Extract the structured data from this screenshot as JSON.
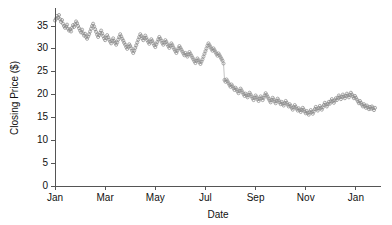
{
  "chart_data": {
    "type": "scatter",
    "title": "",
    "xlabel": "Date",
    "ylabel": "Closing Price ($)",
    "xlim": [
      0,
      13
    ],
    "ylim": [
      0,
      38.5
    ],
    "grid": false,
    "legend": null,
    "marker": "open-circle",
    "marker_color": "#8c8c8c",
    "line_color": "#9a9a9a",
    "y_ticks": [
      0,
      5,
      10,
      15,
      20,
      25,
      30,
      35
    ],
    "y_tick_labels": [
      "0",
      "5",
      "10",
      "15",
      "20",
      "25",
      "30",
      "35"
    ],
    "x_ticks": [
      0,
      2,
      4,
      6,
      8,
      10,
      12
    ],
    "x_tick_labels": [
      "Jan",
      "Mar",
      "May",
      "Jul",
      "Sep",
      "Nov",
      "Jan"
    ],
    "x": [
      0.0,
      0.04,
      0.08,
      0.12,
      0.16,
      0.2,
      0.24,
      0.28,
      0.32,
      0.36,
      0.4,
      0.44,
      0.48,
      0.52,
      0.56,
      0.6,
      0.64,
      0.68,
      0.72,
      0.76,
      0.8,
      0.84,
      0.88,
      0.92,
      0.96,
      1.0,
      1.04,
      1.08,
      1.12,
      1.16,
      1.2,
      1.24,
      1.28,
      1.32,
      1.36,
      1.4,
      1.44,
      1.48,
      1.52,
      1.56,
      1.6,
      1.64,
      1.68,
      1.72,
      1.76,
      1.8,
      1.84,
      1.88,
      1.92,
      1.96,
      2.0,
      2.04,
      2.08,
      2.12,
      2.16,
      2.2,
      2.24,
      2.28,
      2.32,
      2.36,
      2.4,
      2.44,
      2.48,
      2.52,
      2.56,
      2.6,
      2.64,
      2.68,
      2.72,
      2.76,
      2.8,
      2.84,
      2.88,
      2.92,
      2.96,
      3.0,
      3.04,
      3.08,
      3.12,
      3.16,
      3.2,
      3.24,
      3.28,
      3.32,
      3.36,
      3.4,
      3.44,
      3.48,
      3.52,
      3.56,
      3.6,
      3.64,
      3.68,
      3.72,
      3.76,
      3.8,
      3.84,
      3.88,
      3.92,
      3.96,
      4.0,
      4.04,
      4.08,
      4.12,
      4.16,
      4.2,
      4.24,
      4.28,
      4.32,
      4.36,
      4.4,
      4.44,
      4.48,
      4.52,
      4.56,
      4.6,
      4.64,
      4.68,
      4.72,
      4.76,
      4.8,
      4.84,
      4.88,
      4.92,
      4.96,
      5.0,
      5.04,
      5.08,
      5.12,
      5.16,
      5.2,
      5.24,
      5.28,
      5.32,
      5.36,
      5.4,
      5.44,
      5.48,
      5.52,
      5.56,
      5.6,
      5.64,
      5.68,
      5.72,
      5.76,
      5.8,
      5.84,
      5.88,
      5.92,
      5.96,
      6.0,
      6.04,
      6.08,
      6.12,
      6.16,
      6.2,
      6.24,
      6.28,
      6.32,
      6.36,
      6.4,
      6.44,
      6.48,
      6.52,
      6.56,
      6.6,
      6.64,
      6.68,
      6.72,
      6.76,
      6.8,
      6.84,
      6.88,
      6.92,
      6.96,
      7.0,
      7.04,
      7.08,
      7.12,
      7.16,
      7.2,
      7.24,
      7.28,
      7.32,
      7.36,
      7.4,
      7.44,
      7.48,
      7.52,
      7.56,
      7.6,
      7.64,
      7.68,
      7.72,
      7.76,
      7.8,
      7.84,
      7.88,
      7.92,
      7.96,
      8.0,
      8.04,
      8.08,
      8.12,
      8.16,
      8.2,
      8.24,
      8.28,
      8.32,
      8.36,
      8.4,
      8.44,
      8.48,
      8.52,
      8.56,
      8.6,
      8.64,
      8.68,
      8.72,
      8.76,
      8.8,
      8.84,
      8.88,
      8.92,
      8.96,
      9.0,
      9.04,
      9.08,
      9.12,
      9.16,
      9.2,
      9.24,
      9.28,
      9.32,
      9.36,
      9.4,
      9.44,
      9.48,
      9.52,
      9.56,
      9.6,
      9.64,
      9.68,
      9.72,
      9.76,
      9.8,
      9.84,
      9.88,
      9.92,
      9.96,
      10.0,
      10.04,
      10.08,
      10.12,
      10.16,
      10.2,
      10.24,
      10.28,
      10.32,
      10.36,
      10.4,
      10.44,
      10.48,
      10.52,
      10.56,
      10.6,
      10.64,
      10.68,
      10.72,
      10.76,
      10.8,
      10.84,
      10.88,
      10.92,
      10.96,
      11.0,
      11.04,
      11.08,
      11.12,
      11.16,
      11.2,
      11.24,
      11.28,
      11.32,
      11.36,
      11.4,
      11.44,
      11.48,
      11.52,
      11.56,
      11.6,
      11.64,
      11.68,
      11.72,
      11.76,
      11.8,
      11.84,
      11.88,
      11.92,
      11.96,
      12.0,
      12.04,
      12.08,
      12.12,
      12.16,
      12.2,
      12.24,
      12.28,
      12.32,
      12.36,
      12.4,
      12.44,
      12.48,
      12.52,
      12.56,
      12.6,
      12.64,
      12.68,
      12.72,
      12.76
    ],
    "y": [
      36.2,
      36.6,
      37.2,
      36.8,
      37.4,
      36.5,
      35.9,
      36.3,
      35.5,
      35.0,
      34.6,
      34.9,
      35.3,
      34.4,
      34.0,
      34.3,
      33.8,
      34.6,
      35.2,
      34.8,
      35.4,
      36.0,
      35.6,
      35.0,
      34.5,
      34.0,
      33.6,
      34.2,
      33.4,
      32.9,
      33.3,
      32.6,
      32.2,
      32.7,
      33.2,
      33.8,
      34.4,
      35.0,
      35.5,
      34.9,
      34.3,
      33.7,
      33.1,
      32.6,
      33.0,
      33.5,
      34.0,
      33.4,
      32.8,
      32.3,
      31.9,
      32.4,
      33.0,
      32.5,
      32.0,
      31.6,
      31.2,
      31.8,
      32.3,
      31.7,
      31.3,
      30.9,
      31.4,
      32.0,
      32.6,
      33.2,
      32.7,
      32.2,
      31.8,
      31.3,
      30.9,
      30.4,
      30.0,
      30.5,
      31.0,
      30.6,
      30.1,
      29.6,
      29.1,
      29.6,
      30.2,
      30.8,
      31.4,
      32.0,
      32.6,
      33.2,
      32.8,
      32.3,
      31.9,
      32.4,
      32.9,
      32.4,
      31.9,
      31.5,
      31.1,
      31.6,
      32.1,
      31.7,
      31.2,
      30.8,
      30.4,
      31.0,
      31.5,
      32.1,
      32.6,
      32.2,
      31.8,
      31.3,
      30.9,
      31.4,
      31.9,
      31.5,
      31.0,
      30.6,
      30.2,
      30.7,
      31.2,
      30.8,
      30.3,
      29.9,
      29.5,
      29.1,
      29.6,
      30.1,
      30.6,
      30.2,
      29.8,
      29.4,
      29.0,
      28.6,
      29.1,
      28.7,
      28.3,
      28.8,
      29.3,
      28.9,
      28.5,
      28.1,
      27.7,
      27.3,
      26.9,
      27.4,
      27.9,
      27.5,
      27.1,
      26.7,
      27.2,
      27.7,
      28.3,
      28.9,
      29.5,
      30.1,
      30.7,
      31.2,
      30.8,
      30.4,
      30.0,
      29.6,
      30.1,
      29.7,
      29.3,
      28.9,
      28.5,
      29.0,
      28.6,
      28.2,
      27.8,
      27.4,
      26.8,
      23.2,
      22.8,
      23.3,
      22.9,
      22.5,
      22.1,
      21.7,
      22.2,
      21.8,
      21.4,
      21.0,
      21.5,
      21.1,
      20.7,
      20.3,
      20.8,
      21.3,
      20.9,
      20.5,
      20.1,
      19.7,
      20.2,
      19.8,
      19.4,
      19.9,
      20.4,
      20.0,
      19.6,
      19.2,
      18.8,
      19.3,
      19.8,
      19.4,
      19.0,
      18.6,
      19.1,
      19.6,
      19.2,
      18.8,
      19.3,
      19.8,
      20.3,
      19.9,
      19.5,
      19.1,
      18.7,
      18.3,
      18.8,
      19.3,
      18.9,
      18.5,
      18.1,
      18.6,
      19.1,
      18.7,
      18.3,
      17.9,
      18.4,
      18.0,
      17.6,
      18.1,
      18.6,
      18.2,
      17.8,
      17.4,
      17.9,
      17.5,
      17.1,
      16.7,
      17.2,
      17.7,
      17.3,
      16.9,
      16.5,
      17.0,
      16.6,
      16.2,
      16.6,
      17.1,
      16.7,
      16.3,
      15.9,
      16.4,
      16.0,
      15.6,
      16.1,
      16.6,
      16.2,
      15.8,
      16.3,
      16.8,
      17.3,
      16.9,
      16.5,
      17.0,
      17.5,
      17.1,
      16.7,
      17.2,
      17.7,
      18.2,
      17.8,
      17.4,
      17.9,
      18.4,
      18.0,
      18.5,
      19.0,
      18.6,
      18.2,
      18.7,
      19.2,
      18.8,
      19.3,
      19.8,
      19.4,
      19.0,
      19.5,
      20.0,
      19.6,
      19.2,
      19.7,
      20.2,
      19.8,
      19.4,
      19.9,
      20.4,
      20.0,
      19.6,
      19.2,
      19.7,
      19.3,
      18.9,
      18.5,
      18.1,
      18.6,
      18.2,
      17.8,
      17.4,
      17.9,
      17.5,
      17.1,
      17.6,
      17.2,
      16.8,
      17.3,
      16.9,
      17.4,
      17.0,
      16.6,
      17.1
    ]
  }
}
